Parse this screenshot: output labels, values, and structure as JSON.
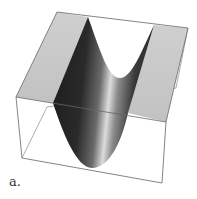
{
  "figure": {
    "label": "a.",
    "surface_type": "parabolic-cylinder",
    "colors": {
      "top_face": "#c8c8c8",
      "box_edges": "#777777",
      "surface_dark": "#1a1a1a",
      "surface_highlight": "#e0e0e0",
      "background": "#ffffff"
    }
  }
}
